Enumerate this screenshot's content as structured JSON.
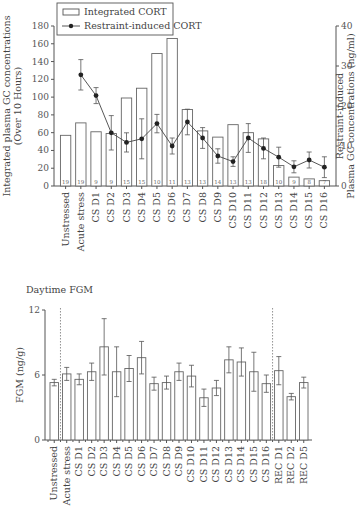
{
  "chart_data": [
    {
      "type": "bar",
      "title": "",
      "categories": [
        "Unstressed",
        "Acute stress",
        "CS D1",
        "CS D2",
        "CS D3",
        "CS D4",
        "CS D5",
        "CS D6",
        "CS D7",
        "CS D8",
        "CS D9",
        "CS D10",
        "CS D11",
        "CS D12",
        "CS D13",
        "CS D14",
        "CS D15",
        "CS D16"
      ],
      "ylabel": "Integrated plasma GC concentrations\n(Over 10 Hours)",
      "ylabel_lines": [
        "Integrated plasma GC concentrations",
        "(Over 10 Hours)"
      ],
      "y2label_lines": [
        "Restraint-induced",
        "Plasma GC concentrations (ng/ml)"
      ],
      "ylim": [
        0,
        180
      ],
      "yticks": [
        0,
        20,
        40,
        60,
        80,
        100,
        120,
        140,
        160,
        180
      ],
      "y2lim": [
        0,
        40
      ],
      "y2ticks": [
        0,
        10,
        20,
        30,
        40
      ],
      "legend": {
        "placement": "top",
        "entries": [
          "Integrated CORT",
          "Restraint-induced CORT"
        ]
      },
      "series": [
        {
          "name": "Integrated CORT",
          "kind": "bar",
          "axis": "left",
          "values": [
            57,
            71,
            61,
            59,
            99,
            110,
            149,
            166,
            86,
            62,
            55,
            69,
            60,
            53,
            23,
            10,
            8,
            6
          ],
          "n": [
            19,
            19,
            9,
            9,
            15,
            15,
            10,
            11,
            13,
            13,
            14,
            13,
            13,
            18,
            10,
            9,
            8,
            7
          ]
        },
        {
          "name": "Restraint-induced CORT",
          "kind": "line",
          "axis": "right",
          "values": [
            null,
            27.8,
            22.6,
            13.3,
            10.9,
            11.8,
            15.6,
            10.0,
            16.0,
            12.0,
            7.5,
            6.1,
            12.0,
            9.4,
            7.2,
            4.8,
            6.5,
            4.7
          ],
          "errors": [
            null,
            3.8,
            2.0,
            4.3,
            2.4,
            5.0,
            2.3,
            2.0,
            3.2,
            2.6,
            1.8,
            1.2,
            3.6,
            2.6,
            2.5,
            1.5,
            2.0,
            2.6
          ]
        }
      ]
    },
    {
      "type": "bar",
      "title": "Daytime FGM",
      "categories": [
        "Unstressed",
        "Acute stress",
        "CS D1",
        "CS D2",
        "CS D3",
        "CS D4",
        "CS D5",
        "CS D6",
        "CS D7",
        "CS D8",
        "CS D9",
        "CS D10",
        "CS D11",
        "CS D12",
        "CS D13",
        "CS D14",
        "CS D15",
        "CS D16",
        "REC D1",
        "REC D2",
        "REC D5"
      ],
      "ylabel": "FGM (ng/g)",
      "ylim": [
        0,
        12
      ],
      "yticks": [
        0,
        6,
        12
      ],
      "separators_after": [
        "Unstressed",
        "CS D16"
      ],
      "series": [
        {
          "name": "Daytime FGM",
          "values": [
            5.3,
            6.1,
            5.6,
            6.3,
            8.6,
            6.3,
            6.6,
            7.6,
            5.2,
            5.3,
            6.3,
            5.9,
            3.9,
            4.8,
            7.4,
            7.2,
            6.3,
            5.2,
            6.4,
            4.0,
            5.3
          ],
          "errors": [
            0.3,
            0.6,
            0.5,
            0.8,
            2.6,
            2.3,
            1.2,
            1.5,
            0.6,
            0.6,
            0.8,
            1.0,
            0.8,
            0.7,
            1.2,
            1.3,
            1.8,
            0.8,
            1.3,
            0.3,
            0.5
          ]
        }
      ]
    }
  ]
}
